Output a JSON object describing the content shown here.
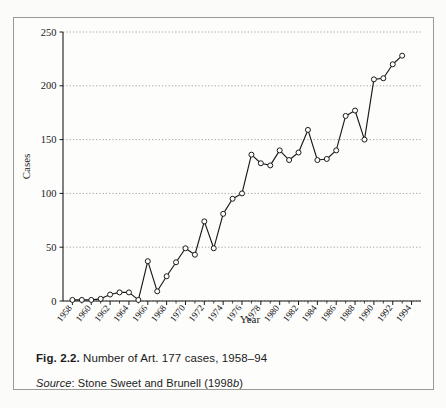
{
  "figure": {
    "caption_prefix": "Fig. 2.2.",
    "caption_text": "Number of Art. 177 cases, 1958–94",
    "source_label": "Source",
    "source_sep": ":",
    "source_text_a": " Stone Sweet and Brunell (1998",
    "source_italic": "b",
    "source_text_b": ")"
  },
  "chart_data": {
    "type": "line",
    "title": "Number of Art. 177 cases, 1958–94",
    "xlabel": "Year",
    "ylabel": "Cases",
    "xlim": [
      1957,
      1995
    ],
    "ylim": [
      0,
      250
    ],
    "yticks": [
      0,
      50,
      100,
      150,
      200,
      250
    ],
    "ytick_labels": [
      "0",
      "50",
      "100",
      "150",
      "200",
      "250"
    ],
    "xticks": [
      1958,
      1960,
      1962,
      1964,
      1966,
      1968,
      1970,
      1972,
      1974,
      1976,
      1978,
      1980,
      1982,
      1984,
      1986,
      1988,
      1990,
      1992,
      1994
    ],
    "xtick_labels": [
      "1958",
      "1960",
      "1962",
      "1964",
      "1966",
      "1968",
      "1970",
      "1972",
      "1974",
      "1976",
      "1978",
      "1980",
      "1982",
      "1984",
      "1986",
      "1988",
      "1990",
      "1992",
      "1994"
    ],
    "grid": "horizontal-dotted",
    "legend": "none",
    "marker": "open-circle",
    "line_color": "#1a1a1a",
    "marker_face_color": "#ffffff",
    "grid_color": "#8a8a88",
    "x": [
      1958,
      1959,
      1960,
      1961,
      1962,
      1963,
      1964,
      1965,
      1966,
      1967,
      1968,
      1969,
      1970,
      1971,
      1972,
      1973,
      1974,
      1975,
      1976,
      1977,
      1978,
      1979,
      1980,
      1981,
      1982,
      1983,
      1984,
      1985,
      1986,
      1987,
      1988,
      1989,
      1990,
      1991,
      1992,
      1993
    ],
    "values": [
      1,
      1,
      1,
      2,
      6,
      8,
      8,
      1,
      37,
      9,
      23,
      36,
      49,
      43,
      74,
      49,
      81,
      95,
      100,
      136,
      128,
      126,
      140,
      131,
      138,
      159,
      131,
      132,
      140,
      172,
      177,
      150,
      206,
      207,
      220,
      228
    ],
    "series": [
      {
        "name": "Art. 177 cases",
        "values": [
          1,
          1,
          1,
          2,
          6,
          8,
          8,
          1,
          37,
          9,
          23,
          36,
          49,
          43,
          74,
          49,
          81,
          95,
          100,
          136,
          128,
          126,
          140,
          131,
          138,
          159,
          131,
          132,
          140,
          172,
          177,
          150,
          206,
          207,
          220,
          228
        ]
      }
    ]
  }
}
